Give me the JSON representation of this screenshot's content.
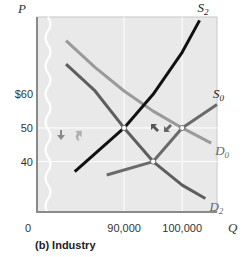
{
  "chart_data": {
    "type": "line",
    "title": "",
    "caption": "(b) Industry",
    "xlabel": "Q",
    "ylabel": "P",
    "origin_label": "0",
    "x_ticks": [
      {
        "value": 90000,
        "label": "90,000"
      },
      {
        "value": 100000,
        "label": "100,000"
      }
    ],
    "y_ticks": [
      {
        "value": 60,
        "label": "$60"
      },
      {
        "value": 50,
        "label": "50"
      },
      {
        "value": 40,
        "label": "40"
      }
    ],
    "xlim": [
      75000,
      106000
    ],
    "ylim": [
      25,
      83
    ],
    "gridlines": {
      "x": [
        90000,
        100000
      ],
      "y": [
        50,
        40
      ]
    },
    "series": [
      {
        "name": "D0",
        "label_main": "D",
        "label_sub": "0",
        "color": "#9a9a9a",
        "points": [
          [
            80000,
            76
          ],
          [
            85000,
            68
          ],
          [
            90000,
            61
          ],
          [
            95000,
            55
          ],
          [
            100000,
            50
          ],
          [
            105000,
            45.5
          ]
        ]
      },
      {
        "name": "D2",
        "label_main": "D",
        "label_sub": "2",
        "color": "#5e5e5e",
        "points": [
          [
            80000,
            69
          ],
          [
            85000,
            61
          ],
          [
            90000,
            50
          ],
          [
            95000,
            40
          ],
          [
            100000,
            33
          ],
          [
            104000,
            29
          ]
        ]
      },
      {
        "name": "S2",
        "label_main": "S",
        "label_sub": "2",
        "color": "#111111",
        "points": [
          [
            81500,
            37
          ],
          [
            90000,
            50
          ],
          [
            95000,
            60
          ],
          [
            100000,
            72.5
          ],
          [
            103000,
            82
          ]
        ]
      },
      {
        "name": "S0",
        "label_main": "S",
        "label_sub": "0",
        "color": "#6a6a6a",
        "points": [
          [
            87000,
            36
          ],
          [
            95000,
            40
          ],
          [
            100000,
            50
          ],
          [
            106000,
            57
          ]
        ]
      }
    ],
    "equilibria": [
      {
        "q": 90000,
        "p": 50
      },
      {
        "q": 95000,
        "p": 40
      },
      {
        "q": 100000,
        "p": 50
      }
    ],
    "annotations": [
      {
        "type": "arrow",
        "direction": "down",
        "near_price": 50,
        "side": "left"
      },
      {
        "type": "arrow",
        "direction": "up-curved",
        "near_price": 50,
        "side": "left"
      },
      {
        "type": "arrow",
        "direction": "up-left",
        "between": "equilibria"
      },
      {
        "type": "arrow",
        "direction": "down-left",
        "between": "equilibria"
      }
    ],
    "legend": "none",
    "grid": true
  },
  "colors": {
    "plot_bg": "#e9e9e9",
    "axis": "#8a8a8a",
    "grid": "#ffffff"
  }
}
